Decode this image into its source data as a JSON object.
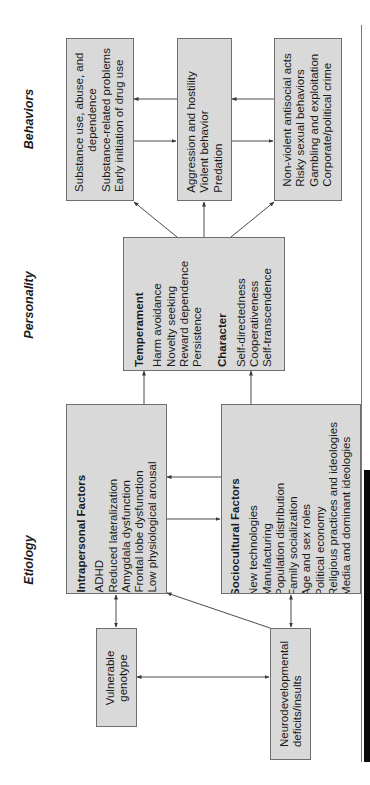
{
  "column_labels": {
    "behaviors": "Behaviors",
    "personality": "Personality",
    "etiology": "Etiology"
  },
  "behaviors": {
    "substance": {
      "items": [
        "Substance use, abuse, and",
        "dependence",
        "Substance-related problems",
        "Early initiation of drug use"
      ]
    },
    "aggression": {
      "items": [
        "Aggression and hostility",
        "Violent behavior",
        "Predation"
      ]
    },
    "nonviolent": {
      "items": [
        "Non-violent antisocial acts",
        "Risky sexual behaviors",
        "Gambling and exploitation",
        "Corporate/political crime"
      ]
    }
  },
  "personality": {
    "temperament": {
      "title": "Temperament",
      "items": [
        "Harm avoidance",
        "Novelty seeking",
        "Reward dependence",
        "Persistence"
      ]
    },
    "character": {
      "title": "Character",
      "items": [
        "Self-directedness",
        "Cooperativeness",
        "Self-transcendence"
      ]
    }
  },
  "etiology": {
    "intrapersonal": {
      "title": "Intrapersonal Factors",
      "items": [
        "ADHD",
        "Reduced lateralization",
        "Amygdala dysfunction",
        "Frontal lobe dysfunction",
        "Low physiological arousal"
      ]
    },
    "sociocultural": {
      "title": "Sociocultural Factors",
      "items": [
        "New technologies",
        "Manufacturing",
        "Population distribution",
        "Family socialization",
        "Age and sex roles",
        "Political economy",
        "Religious practices and ideologies",
        "Media and dominant ideologies"
      ]
    },
    "genotype": {
      "items": [
        "Vulnerable",
        "genotype"
      ]
    },
    "neuro": {
      "items": [
        "Neurodevelopmental",
        "deficits/insults"
      ]
    }
  },
  "colors": {
    "box_fill": "#d9d9d9",
    "box_border": "#6f6f6f",
    "arrow": "#4a4a4a"
  }
}
